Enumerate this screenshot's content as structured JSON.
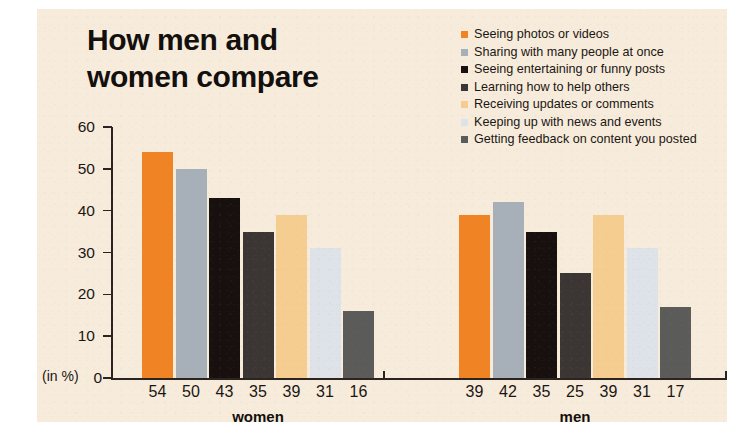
{
  "title": "How men and\nwomen compare",
  "axis": {
    "unit_note": "(in %)",
    "yticks": [
      0,
      10,
      20,
      30,
      40,
      50,
      60
    ],
    "ylabel": "",
    "xlabel": ""
  },
  "legend": [
    {
      "label": "Seeing photos or videos",
      "color": "#f08323"
    },
    {
      "label": "Sharing with many people at once",
      "color": "#a7b0b8"
    },
    {
      "label": "Seeing entertaining or funny posts",
      "color": "#17100e"
    },
    {
      "label": "Learning how to help others",
      "color": "#3b3634"
    },
    {
      "label": "Receiving updates or comments",
      "color": "#f6cd90"
    },
    {
      "label": "Keeping up with news and events",
      "color": "#dde3e8"
    },
    {
      "label": "Getting feedback on content you posted",
      "color": "#5b5b59"
    }
  ],
  "groups": [
    {
      "name": "women",
      "values": [
        54,
        50,
        43,
        35,
        39,
        31,
        16
      ]
    },
    {
      "name": "men",
      "values": [
        39,
        42,
        35,
        25,
        39,
        31,
        17
      ]
    }
  ],
  "chart_data": {
    "type": "bar",
    "title": "How men and women compare",
    "subtitle": "",
    "xlabel": "",
    "ylabel": "(in %)",
    "ylim": [
      0,
      60
    ],
    "yticks": [
      0,
      10,
      20,
      30,
      40,
      50,
      60
    ],
    "grid": false,
    "legend_position": "top-right",
    "categories": [
      "women",
      "men"
    ],
    "series": [
      {
        "name": "Seeing photos or videos",
        "color": "#f08323",
        "values": [
          54,
          39
        ]
      },
      {
        "name": "Sharing with many people at once",
        "color": "#a7b0b8",
        "values": [
          50,
          42
        ]
      },
      {
        "name": "Seeing entertaining or funny posts",
        "color": "#17100e",
        "values": [
          43,
          35
        ]
      },
      {
        "name": "Learning how to help others",
        "color": "#3b3634",
        "values": [
          35,
          25
        ]
      },
      {
        "name": "Receiving updates or comments",
        "color": "#f6cd90",
        "values": [
          39,
          39
        ]
      },
      {
        "name": "Keeping up with news and events",
        "color": "#dde3e8",
        "values": [
          31,
          31
        ]
      },
      {
        "name": "Getting feedback on content you posted",
        "color": "#5b5b59",
        "values": [
          16,
          17
        ]
      }
    ],
    "data_labels": {
      "women": [
        54,
        50,
        43,
        35,
        39,
        31,
        16
      ],
      "men": [
        39,
        42,
        35,
        25,
        39,
        31,
        17
      ]
    }
  },
  "colors": {
    "panel_background": "#f7ecdc",
    "page_background": "#ffffff",
    "axis": "#2a2320",
    "text": "#1a1512"
  }
}
